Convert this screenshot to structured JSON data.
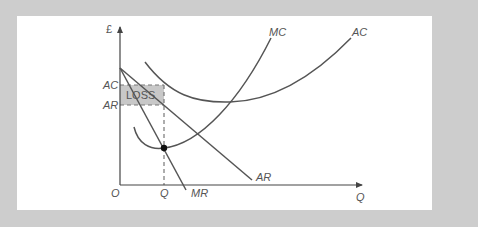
{
  "diagram": {
    "type": "economics-cost-revenue",
    "title": "",
    "axes": {
      "y_label": "£",
      "x_label": "Q",
      "origin_label": "O"
    },
    "curves": {
      "mc": "MC",
      "ac": "AC",
      "ar": "AR",
      "mr": "MR"
    },
    "price_labels": {
      "ac_level": "AC",
      "ar_level": "AR"
    },
    "quantity_label": "Q",
    "loss_area_label": "LOSS",
    "colors": {
      "frame": "#cdcdcd",
      "panel": "#ffffff",
      "curve": "#555555",
      "loss_fill": "#c8c8c8",
      "dashed": "#666666",
      "point": "#111111"
    }
  }
}
